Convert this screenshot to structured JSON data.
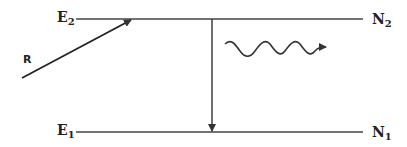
{
  "diagram": {
    "type": "two-level energy diagram",
    "levels": {
      "upper": {
        "energy_label": "E",
        "energy_sub": "2",
        "population_label": "N",
        "population_sub": "2"
      },
      "lower": {
        "energy_label": "E",
        "energy_sub": "1",
        "population_label": "N",
        "population_sub": "1"
      }
    },
    "pump": {
      "label": "R"
    },
    "transition": {
      "description": "downward arrow from upper level to lower level"
    },
    "emission": {
      "description": "wavy arrow representing emitted photon"
    }
  },
  "colors": {
    "line": "#333333",
    "background": "#ffffff"
  }
}
